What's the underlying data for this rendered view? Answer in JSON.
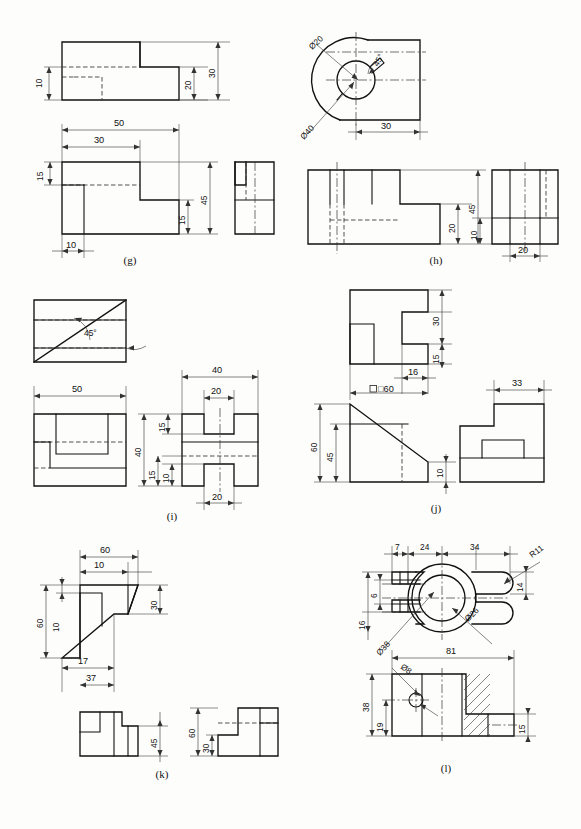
{
  "sheet": {
    "title": "Orthographic projection exercises (g)-(l)",
    "background_color": "#fdfdfb",
    "line_color": "#111111",
    "figure_count": 6
  },
  "figures": [
    {
      "id": "g",
      "caption": "(g)",
      "views": [
        "front (top-left)",
        "top (lower-left)",
        "side (right)"
      ],
      "dimensions": [
        {
          "label": "10",
          "view": "front",
          "orientation": "vertical"
        },
        {
          "label": "20",
          "view": "front",
          "orientation": "vertical"
        },
        {
          "label": "30",
          "view": "front",
          "orientation": "vertical"
        },
        {
          "label": "50",
          "view": "top",
          "orientation": "horizontal"
        },
        {
          "label": "30",
          "view": "top",
          "orientation": "horizontal"
        },
        {
          "label": "15",
          "view": "top",
          "orientation": "vertical"
        },
        {
          "label": "45",
          "view": "top",
          "orientation": "vertical"
        },
        {
          "label": "15",
          "view": "top",
          "orientation": "vertical"
        },
        {
          "label": "10",
          "view": "top",
          "orientation": "horizontal"
        }
      ]
    },
    {
      "id": "h",
      "caption": "(h)",
      "views": [
        "top (circular)",
        "front",
        "side"
      ],
      "dimensions": [
        {
          "label": "Ø20",
          "view": "top",
          "orientation": "diameter"
        },
        {
          "label": "Ø40",
          "view": "top",
          "orientation": "diameter"
        },
        {
          "label": "45°",
          "view": "top",
          "orientation": "angle"
        },
        {
          "label": "30",
          "view": "top",
          "orientation": "horizontal"
        },
        {
          "label": "45",
          "view": "front",
          "orientation": "vertical"
        },
        {
          "label": "20",
          "view": "front",
          "orientation": "vertical"
        },
        {
          "label": "10",
          "view": "side",
          "orientation": "vertical"
        },
        {
          "label": "20",
          "view": "side",
          "orientation": "horizontal"
        }
      ]
    },
    {
      "id": "i",
      "caption": "(i)",
      "views": [
        "top",
        "front",
        "side"
      ],
      "dimensions": [
        {
          "label": "45°",
          "view": "top",
          "orientation": "angle"
        },
        {
          "label": "50",
          "view": "front",
          "orientation": "horizontal"
        },
        {
          "label": "40",
          "view": "side",
          "orientation": "horizontal"
        },
        {
          "label": "20",
          "view": "side",
          "orientation": "horizontal"
        },
        {
          "label": "40",
          "view": "side",
          "orientation": "vertical"
        },
        {
          "label": "15",
          "view": "side",
          "orientation": "vertical"
        },
        {
          "label": "15",
          "view": "side",
          "orientation": "vertical"
        },
        {
          "label": "10",
          "view": "side",
          "orientation": "vertical"
        },
        {
          "label": "20",
          "view": "side",
          "orientation": "horizontal"
        }
      ]
    },
    {
      "id": "j",
      "caption": "(j)",
      "views": [
        "top",
        "front",
        "side"
      ],
      "dimensions": [
        {
          "label": "30",
          "view": "top",
          "orientation": "vertical"
        },
        {
          "label": "15",
          "view": "top",
          "orientation": "vertical"
        },
        {
          "label": "16",
          "view": "top",
          "orientation": "horizontal"
        },
        {
          "label": "□60",
          "view": "top",
          "orientation": "horizontal"
        },
        {
          "label": "60",
          "view": "front",
          "orientation": "vertical"
        },
        {
          "label": "45",
          "view": "front",
          "orientation": "vertical"
        },
        {
          "label": "10",
          "view": "front",
          "orientation": "vertical"
        },
        {
          "label": "33",
          "view": "side",
          "orientation": "horizontal"
        }
      ]
    },
    {
      "id": "k",
      "caption": "(k)",
      "views": [
        "front (with slope)",
        "top",
        "side"
      ],
      "dimensions": [
        {
          "label": "60",
          "view": "front",
          "orientation": "horizontal"
        },
        {
          "label": "10",
          "view": "front",
          "orientation": "horizontal"
        },
        {
          "label": "60",
          "view": "front",
          "orientation": "vertical"
        },
        {
          "label": "10",
          "view": "front",
          "orientation": "vertical"
        },
        {
          "label": "30",
          "view": "front",
          "orientation": "vertical"
        },
        {
          "label": "17",
          "view": "front",
          "orientation": "horizontal"
        },
        {
          "label": "37",
          "view": "front",
          "orientation": "horizontal"
        },
        {
          "label": "45",
          "view": "top",
          "orientation": "vertical"
        },
        {
          "label": "60",
          "view": "side",
          "orientation": "vertical"
        },
        {
          "label": "30",
          "view": "side",
          "orientation": "vertical"
        }
      ]
    },
    {
      "id": "l",
      "caption": "(l)",
      "views": [
        "top (yoke)",
        "front (section)"
      ],
      "dimensions": [
        {
          "label": "7",
          "view": "top",
          "orientation": "horizontal"
        },
        {
          "label": "24",
          "view": "top",
          "orientation": "horizontal"
        },
        {
          "label": "34",
          "view": "top",
          "orientation": "horizontal"
        },
        {
          "label": "R11",
          "view": "top",
          "orientation": "radius"
        },
        {
          "label": "6",
          "view": "top",
          "orientation": "vertical"
        },
        {
          "label": "16",
          "view": "top",
          "orientation": "vertical"
        },
        {
          "label": "14",
          "view": "top",
          "orientation": "vertical"
        },
        {
          "label": "Ø38",
          "view": "top",
          "orientation": "diameter"
        },
        {
          "label": "Ø26",
          "view": "top",
          "orientation": "diameter"
        },
        {
          "label": "81",
          "view": "front",
          "orientation": "horizontal"
        },
        {
          "label": "15",
          "view": "front",
          "orientation": "vertical"
        },
        {
          "label": "38",
          "view": "front",
          "orientation": "vertical"
        },
        {
          "label": "19",
          "view": "front",
          "orientation": "vertical"
        },
        {
          "label": "Ø8",
          "view": "front",
          "orientation": "diameter"
        }
      ]
    }
  ],
  "labels": {
    "g": {
      "d_10_a": "10",
      "d_20": "20",
      "d_30": "30",
      "d_50": "50",
      "d_30b": "30",
      "d_15a": "15",
      "d_45": "45",
      "d_15b": "15",
      "d_10b": "10",
      "caption": "(g)"
    },
    "h": {
      "d20": "Ø20",
      "d40": "Ø40",
      "ang": "45°",
      "d_30": "30",
      "d_45": "45",
      "d_20": "20",
      "d_10": "10",
      "d_20b": "20",
      "caption": "(h)"
    },
    "i": {
      "ang": "45°",
      "d_50": "50",
      "d_40t": "40",
      "d_20t": "20",
      "d_40v": "40",
      "d_15a": "15",
      "d_15b": "15",
      "d_10": "10",
      "d_20b": "20",
      "caption": "(i)"
    },
    "j": {
      "d_30": "30",
      "d_15": "15",
      "d_16": "16",
      "d_sq60": "□60",
      "d_60": "60",
      "d_45": "45",
      "d_10": "10",
      "d_33": "33",
      "caption": "(j)"
    },
    "k": {
      "d_60t": "60",
      "d_10t": "10",
      "d_60v": "60",
      "d_10v": "10",
      "d_30": "30",
      "d_17": "17",
      "d_37": "37",
      "d_45": "45",
      "d_60s": "60",
      "d_30s": "30",
      "caption": "(k)"
    },
    "l": {
      "d_7": "7",
      "d_24": "24",
      "d_34": "34",
      "d_r11": "R11",
      "d_6": "6",
      "d_16": "16",
      "d_14": "14",
      "d_38c": "Ø38",
      "d_26c": "Ø26",
      "d_81": "81",
      "d_15": "15",
      "d_38": "38",
      "d_19": "19",
      "d_8": "Ø8",
      "caption": "(l)"
    }
  }
}
